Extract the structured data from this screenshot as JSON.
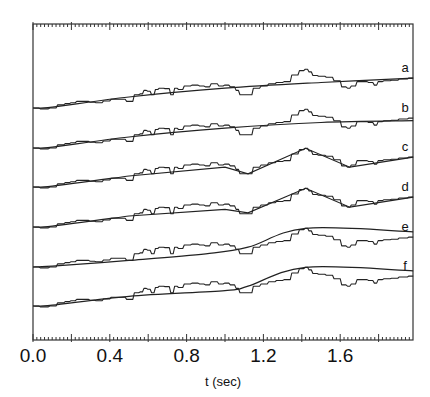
{
  "chart_data": {
    "type": "line",
    "title": "",
    "xlabel": "t (sec)",
    "ylabel": "",
    "xlim": [
      0.0,
      1.98
    ],
    "x_ticks": [
      "0.0",
      "0.4",
      "0.8",
      "1.2",
      "1.6"
    ],
    "x_tick_values": [
      0.0,
      0.4,
      0.8,
      1.2,
      1.6
    ],
    "minor_tick_step": 0.02,
    "major_tick_step": 0.2,
    "grid": false,
    "legend": "inline labels at right end of each trace",
    "series_labels": [
      "a",
      "b",
      "c",
      "d",
      "e",
      "f"
    ],
    "measured_signal": {
      "t": [
        0.0,
        0.06,
        0.1,
        0.14,
        0.18,
        0.2,
        0.24,
        0.28,
        0.3,
        0.34,
        0.38,
        0.42,
        0.46,
        0.5,
        0.54,
        0.56,
        0.58,
        0.6,
        0.62,
        0.64,
        0.66,
        0.7,
        0.72,
        0.74,
        0.76,
        0.8,
        0.84,
        0.88,
        0.9,
        0.94,
        0.98,
        1.0,
        1.04,
        1.06,
        1.08,
        1.12,
        1.16,
        1.2,
        1.24,
        1.28,
        1.32,
        1.36,
        1.4,
        1.42,
        1.44,
        1.46,
        1.5,
        1.54,
        1.58,
        1.62,
        1.64,
        1.66,
        1.7,
        1.72,
        1.76,
        1.78,
        1.8,
        1.84,
        1.88,
        1.92,
        1.98
      ],
      "value": [
        0.0,
        -0.02,
        0.0,
        0.07,
        0.1,
        0.12,
        0.15,
        0.15,
        0.13,
        0.12,
        0.16,
        0.2,
        0.2,
        0.15,
        0.3,
        0.32,
        0.4,
        0.38,
        0.3,
        0.42,
        0.45,
        0.44,
        0.3,
        0.45,
        0.42,
        0.5,
        0.52,
        0.5,
        0.48,
        0.55,
        0.5,
        0.52,
        0.48,
        0.4,
        0.3,
        0.3,
        0.45,
        0.5,
        0.55,
        0.58,
        0.6,
        0.75,
        0.85,
        0.88,
        0.82,
        0.74,
        0.72,
        0.7,
        0.62,
        0.48,
        0.45,
        0.5,
        0.6,
        0.6,
        0.58,
        0.52,
        0.6,
        0.62,
        0.63,
        0.66,
        0.68
      ]
    },
    "fits": [
      {
        "name": "a",
        "shape": "smooth monotonic rise",
        "t": [
          0.0,
          0.1,
          0.5,
          1.0,
          1.5,
          1.98
        ],
        "value": [
          0.0,
          0.02,
          0.25,
          0.45,
          0.58,
          0.68
        ]
      },
      {
        "name": "b",
        "shape": "smooth rise then flat",
        "t": [
          0.0,
          0.1,
          0.5,
          1.0,
          1.5,
          1.98
        ],
        "value": [
          0.0,
          0.02,
          0.25,
          0.45,
          0.58,
          0.62
        ]
      },
      {
        "name": "c",
        "shape": "piecewise: rise, peak at ~1.42, drop to min at ~1.65, rise",
        "t": [
          0.0,
          0.1,
          0.5,
          1.0,
          1.12,
          1.42,
          1.65,
          1.98
        ],
        "value": [
          0.0,
          0.02,
          0.25,
          0.45,
          0.3,
          0.88,
          0.45,
          0.68
        ]
      },
      {
        "name": "d",
        "shape": "piecewise: rise, peak at ~1.42, min ~1.65, rise",
        "t": [
          0.0,
          0.1,
          0.5,
          1.0,
          1.12,
          1.42,
          1.65,
          1.98
        ],
        "value": [
          0.0,
          0.02,
          0.25,
          0.4,
          0.32,
          0.88,
          0.45,
          0.68
        ]
      },
      {
        "name": "e",
        "shape": "smooth rise to peak ~1.42 then slow decay",
        "t": [
          0.0,
          0.1,
          0.5,
          0.9,
          1.12,
          1.42,
          1.98
        ],
        "value": [
          0.0,
          0.02,
          0.15,
          0.3,
          0.45,
          0.88,
          0.8
        ]
      },
      {
        "name": "f",
        "shape": "rise to peak ~1.42 then slow decay",
        "t": [
          0.0,
          0.1,
          0.5,
          1.0,
          1.12,
          1.42,
          1.98
        ],
        "value": [
          0.0,
          0.02,
          0.22,
          0.35,
          0.45,
          0.88,
          0.8
        ]
      }
    ]
  },
  "layout": {
    "frame": {
      "left": 33,
      "right": 413,
      "top": 24,
      "bottom": 340
    },
    "px_per_sec": 192,
    "px_per_unit": 44,
    "baselines": [
      108,
      148,
      187,
      227,
      267,
      306
    ],
    "label_offsets": [
      -24,
      -24,
      -24,
      -24,
      -24,
      -24
    ]
  },
  "colors": {
    "ink": "#222222",
    "background": "#ffffff"
  }
}
